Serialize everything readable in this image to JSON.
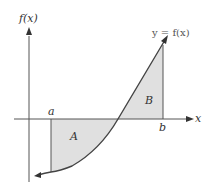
{
  "diagram": {
    "y_axis_label": "f(x)",
    "x_axis_label": "x",
    "curve_label": "y = f(x)",
    "point_a": "a",
    "point_b": "b",
    "region_a_label": "A",
    "region_b_label": "B",
    "colors": {
      "axis": "#555555",
      "curve": "#444444",
      "shade": "#e0e0e0",
      "boundary": "#555555"
    }
  }
}
